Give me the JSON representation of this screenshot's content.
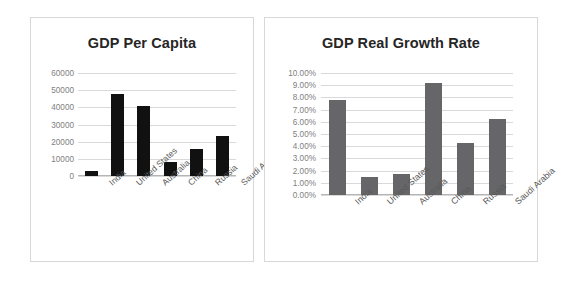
{
  "chart_data": [
    {
      "id": "gdp-per-capita",
      "type": "bar",
      "title": "GDP Per Capita",
      "xlabel": "",
      "ylabel": "",
      "categories": [
        "India",
        "United States",
        "Australia",
        "China",
        "Russia",
        "Saudi Arabia"
      ],
      "values": [
        3000,
        48000,
        40500,
        8000,
        16000,
        23500
      ],
      "yticks": [
        "60000",
        "50000",
        "40000",
        "30000",
        "20000",
        "10000",
        "0"
      ],
      "ytick_values": [
        60000,
        50000,
        40000,
        30000,
        20000,
        10000,
        0
      ],
      "ylim": [
        0,
        60000
      ],
      "grid": true,
      "legend": "none",
      "bar_color": "#111111"
    },
    {
      "id": "gdp-real-growth-rate",
      "type": "bar",
      "title": "GDP Real Growth Rate",
      "xlabel": "",
      "ylabel": "",
      "categories": [
        "India",
        "United States",
        "Australia",
        "China",
        "Russia",
        "Saudi Arabia"
      ],
      "values": [
        7.8,
        1.5,
        1.75,
        9.2,
        4.3,
        6.2
      ],
      "value_labels": [
        "7.80%",
        "1.50%",
        "1.75%",
        "9.20%",
        "4.30%",
        "6.20%"
      ],
      "yticks": [
        "10.00%",
        "9.00%",
        "8.00%",
        "7.00%",
        "6.00%",
        "5.00%",
        "4.00%",
        "3.00%",
        "2.00%",
        "1.00%",
        "0.00%"
      ],
      "ytick_values": [
        10,
        9,
        8,
        7,
        6,
        5,
        4,
        3,
        2,
        1,
        0
      ],
      "ylim": [
        0,
        10
      ],
      "grid": true,
      "legend": "none",
      "bar_color": "#666668"
    }
  ],
  "colors": {
    "background": "#ffffff",
    "panel_border": "#d8d8d8",
    "gridline": "#d9d9d9",
    "axis": "#b5b5b5",
    "title_text": "#262626",
    "tick_text": "#808080",
    "category_text": "#595959"
  }
}
